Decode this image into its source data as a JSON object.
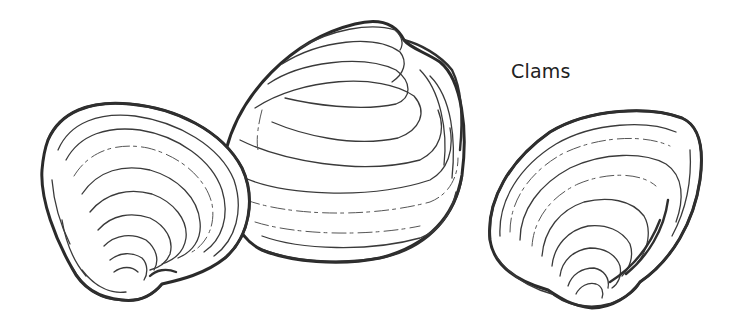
{
  "illustration": {
    "caption": "Clams",
    "subjects": [
      {
        "name": "left-clam-shell",
        "view": "interior"
      },
      {
        "name": "center-clam-shell",
        "view": "exterior"
      },
      {
        "name": "right-clam-shell",
        "view": "interior"
      }
    ],
    "colors": {
      "background": "#ffffff",
      "ink": "#2a2a2a"
    }
  }
}
